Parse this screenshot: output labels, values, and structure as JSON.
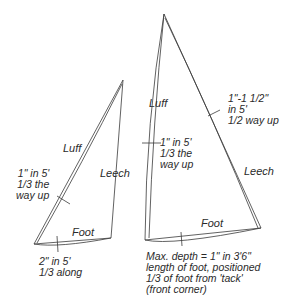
{
  "diagram": {
    "stroke_color": "#3a3a3a",
    "small_sail": {
      "labels": {
        "luff": "Luff",
        "leech": "Leech",
        "foot": "Foot"
      },
      "annotations": {
        "luff_depth": [
          "1\" in 5'",
          "1/3 the",
          "way up"
        ],
        "foot_depth": [
          "2\" in 5'",
          "1/3 along"
        ]
      }
    },
    "large_sail": {
      "labels": {
        "luff": "Luff",
        "leech": "Leech",
        "foot": "Foot"
      },
      "annotations": {
        "leech_depth": [
          "1\"-1 1/2\"",
          "in 5'",
          "1/2 way up"
        ],
        "luff_depth": [
          "1\" in 5'",
          "1/3 the",
          "way up"
        ],
        "foot_depth": [
          "Max. depth = 1\" in 3'6\"",
          "length of foot, positioned",
          "1/3 of foot from 'tack'",
          "(front corner)"
        ]
      }
    }
  }
}
